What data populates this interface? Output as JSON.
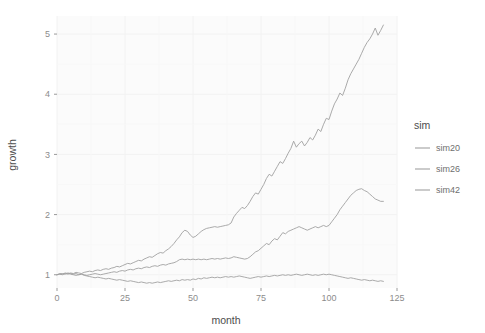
{
  "chart_data": {
    "type": "line",
    "title": "",
    "xlabel": "month",
    "ylabel": "growth",
    "xlim": [
      0,
      125
    ],
    "ylim": [
      0.78,
      5.3
    ],
    "xticks": [
      0,
      25,
      50,
      75,
      100,
      125
    ],
    "yticks": [
      1,
      2,
      3,
      4,
      5
    ],
    "xtick_labels": [
      "0",
      "25",
      "50",
      "75",
      "100",
      "125"
    ],
    "ytick_labels": [
      "1",
      "2",
      "3",
      "4",
      "5"
    ],
    "grid": true,
    "legend_position": "right",
    "legend_title": "sim",
    "panel_background": "#fbfbfb",
    "gridline_color": "#f2f2f2",
    "line_color": "#a8a8a8",
    "x": [
      0,
      1,
      2,
      3,
      4,
      5,
      6,
      7,
      8,
      9,
      10,
      11,
      12,
      13,
      14,
      15,
      16,
      17,
      18,
      19,
      20,
      21,
      22,
      23,
      24,
      25,
      26,
      27,
      28,
      29,
      30,
      31,
      32,
      33,
      34,
      35,
      36,
      37,
      38,
      39,
      40,
      41,
      42,
      43,
      44,
      45,
      46,
      47,
      48,
      49,
      50,
      51,
      52,
      53,
      54,
      55,
      56,
      57,
      58,
      59,
      60,
      61,
      62,
      63,
      64,
      65,
      66,
      67,
      68,
      69,
      70,
      71,
      72,
      73,
      74,
      75,
      76,
      77,
      78,
      79,
      80,
      81,
      82,
      83,
      84,
      85,
      86,
      87,
      88,
      89,
      90,
      91,
      92,
      93,
      94,
      95,
      96,
      97,
      98,
      99,
      100,
      101,
      102,
      103,
      104,
      105,
      106,
      107,
      108,
      109,
      110,
      111,
      112,
      113,
      114,
      115,
      116,
      117,
      118,
      119,
      120
    ],
    "series": [
      {
        "name": "sim20",
        "color": "#a0a0a0",
        "values": [
          1.0,
          1.01,
          1.0,
          1.02,
          1.01,
          1.03,
          1.02,
          1.04,
          1.03,
          1.02,
          1.04,
          1.05,
          1.06,
          1.05,
          1.07,
          1.08,
          1.07,
          1.09,
          1.1,
          1.09,
          1.11,
          1.12,
          1.14,
          1.13,
          1.15,
          1.17,
          1.19,
          1.18,
          1.2,
          1.22,
          1.24,
          1.23,
          1.26,
          1.28,
          1.3,
          1.29,
          1.32,
          1.35,
          1.37,
          1.36,
          1.4,
          1.43,
          1.47,
          1.52,
          1.58,
          1.63,
          1.7,
          1.74,
          1.72,
          1.66,
          1.62,
          1.64,
          1.68,
          1.72,
          1.75,
          1.77,
          1.78,
          1.79,
          1.8,
          1.79,
          1.8,
          1.81,
          1.82,
          1.83,
          1.86,
          1.96,
          2.02,
          2.07,
          2.12,
          2.1,
          2.15,
          2.22,
          2.3,
          2.36,
          2.34,
          2.42,
          2.5,
          2.6,
          2.67,
          2.64,
          2.72,
          2.8,
          2.88,
          2.85,
          2.93,
          3.02,
          3.1,
          3.22,
          3.12,
          3.18,
          3.22,
          3.14,
          3.2,
          3.28,
          3.24,
          3.32,
          3.42,
          3.38,
          3.5,
          3.6,
          3.58,
          3.72,
          3.84,
          3.92,
          4.02,
          3.98,
          4.1,
          4.24,
          4.34,
          4.42,
          4.5,
          4.58,
          4.68,
          4.78,
          4.86,
          4.92,
          5.0,
          5.1,
          4.98,
          5.06,
          5.15
        ]
      },
      {
        "name": "sim26",
        "color": "#a0a0a0",
        "values": [
          1.0,
          1.02,
          1.01,
          1.03,
          1.02,
          1.01,
          1.0,
          0.99,
          1.0,
          1.01,
          1.0,
          0.99,
          1.0,
          1.01,
          1.02,
          1.01,
          1.0,
          1.01,
          1.02,
          1.03,
          1.04,
          1.05,
          1.04,
          1.06,
          1.07,
          1.06,
          1.08,
          1.09,
          1.08,
          1.1,
          1.11,
          1.1,
          1.12,
          1.13,
          1.12,
          1.14,
          1.15,
          1.14,
          1.16,
          1.17,
          1.16,
          1.18,
          1.19,
          1.2,
          1.22,
          1.25,
          1.26,
          1.25,
          1.26,
          1.25,
          1.26,
          1.25,
          1.26,
          1.25,
          1.26,
          1.25,
          1.26,
          1.27,
          1.26,
          1.27,
          1.26,
          1.27,
          1.28,
          1.27,
          1.28,
          1.3,
          1.29,
          1.28,
          1.27,
          1.26,
          1.27,
          1.3,
          1.34,
          1.38,
          1.4,
          1.44,
          1.48,
          1.52,
          1.5,
          1.56,
          1.6,
          1.58,
          1.64,
          1.7,
          1.68,
          1.72,
          1.74,
          1.76,
          1.78,
          1.8,
          1.78,
          1.76,
          1.74,
          1.76,
          1.78,
          1.8,
          1.78,
          1.8,
          1.82,
          1.8,
          1.82,
          1.88,
          1.94,
          2.0,
          2.08,
          2.14,
          2.2,
          2.26,
          2.32,
          2.36,
          2.4,
          2.42,
          2.43,
          2.4,
          2.38,
          2.34,
          2.3,
          2.26,
          2.24,
          2.22,
          2.22
        ]
      },
      {
        "name": "sim42",
        "color": "#a0a0a0",
        "values": [
          1.0,
          1.01,
          1.02,
          1.01,
          1.03,
          1.02,
          1.01,
          1.02,
          1.0,
          1.01,
          0.99,
          0.98,
          0.97,
          0.96,
          0.95,
          0.96,
          0.95,
          0.94,
          0.93,
          0.94,
          0.93,
          0.92,
          0.91,
          0.92,
          0.91,
          0.9,
          0.89,
          0.9,
          0.89,
          0.88,
          0.87,
          0.88,
          0.87,
          0.86,
          0.87,
          0.86,
          0.87,
          0.88,
          0.87,
          0.88,
          0.89,
          0.9,
          0.89,
          0.9,
          0.91,
          0.9,
          0.92,
          0.91,
          0.92,
          0.91,
          0.93,
          0.92,
          0.94,
          0.93,
          0.95,
          0.94,
          0.95,
          0.96,
          0.95,
          0.96,
          0.95,
          0.96,
          0.97,
          0.96,
          0.97,
          0.96,
          0.97,
          0.98,
          0.97,
          0.96,
          0.95,
          0.94,
          0.95,
          0.96,
          0.97,
          0.96,
          0.97,
          0.98,
          0.97,
          0.98,
          0.99,
          0.98,
          0.99,
          1.0,
          0.99,
          1.0,
          0.99,
          1.0,
          1.01,
          1.0,
          0.99,
          1.0,
          1.01,
          1.0,
          0.99,
          1.0,
          0.99,
          1.0,
          1.01,
          1.0,
          1.01,
          1.0,
          0.99,
          0.98,
          0.97,
          0.96,
          0.95,
          0.94,
          0.95,
          0.94,
          0.93,
          0.92,
          0.91,
          0.92,
          0.91,
          0.9,
          0.91,
          0.9,
          0.89,
          0.9,
          0.89
        ]
      }
    ]
  },
  "legend": {
    "title": "sim",
    "items": [
      {
        "label": "sim20"
      },
      {
        "label": "sim26"
      },
      {
        "label": "sim42"
      }
    ]
  },
  "axes": {
    "x_title": "month",
    "y_title": "growth"
  }
}
